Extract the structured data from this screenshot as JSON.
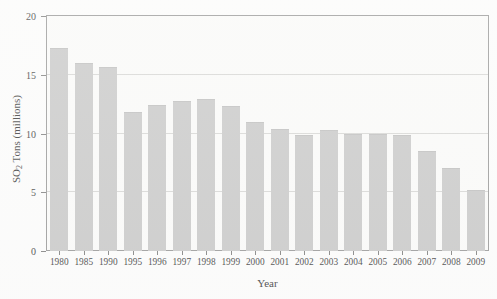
{
  "chart_data": {
    "type": "bar",
    "title": "Acid Rain SO2 Emissions Trends; Source: EPA, 2009",
    "title_parts": {
      "before": "Acid Rain SO",
      "sub": "2",
      "after": " Emissions Trends; Source: EPA, 2009"
    },
    "xlabel": "Year",
    "ylabel": "SO2 Tons (millions)",
    "ylabel_parts": {
      "before": "SO",
      "sub": "2",
      "after": " Tons (millions)"
    },
    "categories": [
      "1980",
      "1985",
      "1990",
      "1995",
      "1996",
      "1997",
      "1998",
      "1999",
      "2000",
      "2001",
      "2002",
      "2003",
      "2004",
      "2005",
      "2006",
      "2007",
      "2008",
      "2009"
    ],
    "values": [
      17.3,
      16.0,
      15.7,
      11.8,
      12.4,
      12.8,
      12.9,
      12.3,
      11.0,
      10.4,
      9.9,
      10.3,
      10.0,
      10.0,
      9.9,
      8.5,
      7.1,
      5.2
    ],
    "ylim": [
      0,
      20
    ],
    "yticks": [
      0,
      5,
      10,
      15,
      20
    ],
    "ytick_labels": [
      "0",
      "5",
      "10",
      "15",
      "20"
    ],
    "grid": true,
    "grid_axis": "y",
    "legend": "none",
    "bar_color": "#c2c2c2",
    "axis_color": "#8a8a8a",
    "grid_color": "#d2d2d0",
    "text_color": "#1b1b1b",
    "background_color": "#fbfbfa"
  }
}
